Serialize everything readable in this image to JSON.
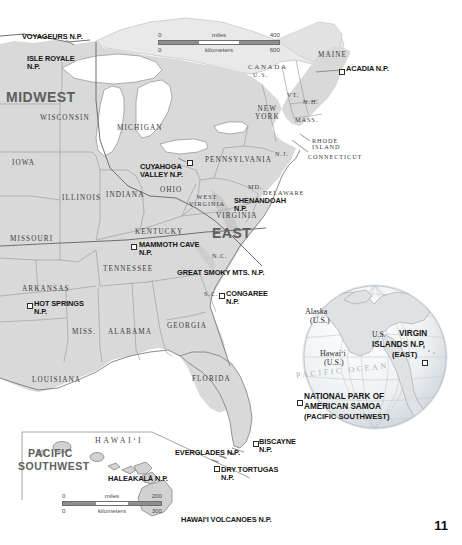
{
  "page": {
    "number": "11"
  },
  "main_map": {
    "regions": [
      {
        "name": "MIDWEST",
        "x": 6,
        "y": 92,
        "size": "big"
      },
      {
        "name": "EAST",
        "x": 212,
        "y": 228,
        "size": "big"
      }
    ],
    "country_labels": [
      {
        "name": "CANADA",
        "x": 248,
        "y": 66
      },
      {
        "name": "U.S.",
        "x": 252,
        "y": 74
      }
    ],
    "states": [
      {
        "name": "WISCONSIN",
        "x": 40,
        "y": 116
      },
      {
        "name": "MICHIGAN",
        "x": 117,
        "y": 126
      },
      {
        "name": "IOWA",
        "x": 12,
        "y": 161
      },
      {
        "name": "ILLINOIS",
        "x": 62,
        "y": 196
      },
      {
        "name": "INDIANA",
        "x": 106,
        "y": 193
      },
      {
        "name": "OHIO",
        "x": 160,
        "y": 188
      },
      {
        "name": "MISSOURI",
        "x": 10,
        "y": 237
      },
      {
        "name": "KENTUCKY",
        "x": 135,
        "y": 230
      },
      {
        "name": "TENNESSEE",
        "x": 103,
        "y": 267
      },
      {
        "name": "ARKANSAS",
        "x": 22,
        "y": 287
      },
      {
        "name": "MISS.",
        "x": 72,
        "y": 330
      },
      {
        "name": "ALABAMA",
        "x": 108,
        "y": 330
      },
      {
        "name": "GEORGIA",
        "x": 167,
        "y": 324
      },
      {
        "name": "LOUISIANA",
        "x": 32,
        "y": 378
      },
      {
        "name": "FLORIDA",
        "x": 192,
        "y": 377
      },
      {
        "name": "S.C.",
        "x": 204,
        "y": 292
      },
      {
        "name": "N.C.",
        "x": 212,
        "y": 254
      },
      {
        "name": "VIRGINIA",
        "x": 216,
        "y": 214
      },
      {
        "name": "WEST\nVIRGINIA",
        "x": 189,
        "y": 195
      },
      {
        "name": "PENNSYLVANIA",
        "x": 208,
        "y": 158
      },
      {
        "name": "MD.",
        "x": 248,
        "y": 185
      },
      {
        "name": "DELAWARE",
        "x": 263,
        "y": 191
      },
      {
        "name": "N.J.",
        "x": 275,
        "y": 152
      },
      {
        "name": "NEW\nYORK",
        "x": 257,
        "y": 110
      },
      {
        "name": "VT.",
        "x": 288,
        "y": 93
      },
      {
        "name": "N.H.",
        "x": 304,
        "y": 100
      },
      {
        "name": "MASS.",
        "x": 296,
        "y": 118
      },
      {
        "name": "MAINE",
        "x": 318,
        "y": 53
      }
    ],
    "callout_states": [
      {
        "name": "RHODE\nISLAND",
        "x": 315,
        "y": 142
      },
      {
        "name": "CONNECTICUT",
        "x": 310,
        "y": 156
      }
    ],
    "parks": [
      {
        "name": "VOYAGEURS N.P.",
        "label_x": 22,
        "label_y": 35,
        "pin_x": 74,
        "pin_y": 45
      },
      {
        "name": "ISLE ROYALE\nN.P.",
        "label_x": 27,
        "label_y": 57,
        "pin_x": 79,
        "pin_y": 72
      },
      {
        "name": "CUYAHOGA\nVALLEY N.P.",
        "label_x": 143,
        "label_y": 164,
        "pin_x": 188,
        "pin_y": 161
      },
      {
        "name": "ACADIA N.P.",
        "label_x": 345,
        "label_y": 68,
        "pin_x": 340,
        "pin_y": 70
      },
      {
        "name": "SHENANDOAH\nN.P.",
        "label_x": 238,
        "label_y": 199,
        "pin_x": 233,
        "pin_y": 203
      },
      {
        "name": "MAMMOTH CAVE\nN.P.",
        "label_x": 141,
        "label_y": 243,
        "pin_x": 133,
        "pin_y": 245
      },
      {
        "name": "GREAT SMOKY MTS. N.P.",
        "label_x": 180,
        "label_y": 271,
        "pin_x": 176,
        "pin_y": 273
      },
      {
        "name": "CONGAREE\nN.P.",
        "label_x": 225,
        "label_y": 292,
        "pin_x": 220,
        "pin_y": 295
      },
      {
        "name": "HOT SPRINGS\nN.P.",
        "label_x": 33,
        "label_y": 302,
        "pin_x": 28,
        "pin_y": 304
      },
      {
        "name": "EVERGLADES N.P.",
        "label_x": 175,
        "label_y": 451,
        "pin_x": 245,
        "pin_y": 450
      },
      {
        "name": "BISCAYNE\nN.P.",
        "label_x": 258,
        "label_y": 441,
        "pin_x": 254,
        "pin_y": 443
      },
      {
        "name": "DRY TORTUGAS\nN.P.",
        "label_x": 220,
        "label_y": 469,
        "pin_x": 215,
        "pin_y": 468
      },
      {
        "name": "HAWAIʻI VOLCANOES N.P.",
        "label_x": 181,
        "label_y": 518,
        "pin_x": 176,
        "pin_y": 516
      },
      {
        "name": "HALEAKALĀ N.P.",
        "label_x": 110,
        "label_y": 478,
        "pin_x": 106,
        "pin_y": 476
      }
    ],
    "scale": {
      "miles_label": "miles",
      "kilometers_label": "kilometers",
      "miles_min": "0",
      "miles_max": "400",
      "km_min": "0",
      "km_max": "600"
    }
  },
  "hawaii_inset": {
    "region": "PACIFIC\nSOUTHWEST",
    "region_line1": "PACIFIC",
    "region_line2": "SOUTHWEST",
    "archipelago_label": "HAWAIʻI",
    "scale": {
      "miles_label": "miles",
      "kilometers_label": "kilometers",
      "miles_min": "0",
      "miles_max": "200",
      "km_min": "0",
      "km_max": "300"
    }
  },
  "globe_inset": {
    "labels": [
      {
        "name": "Alaska\n(U.S.)",
        "line1": "Alaska",
        "line2": "(U.S.)",
        "x": 322,
        "y": 312
      },
      {
        "name": "Hawaiʻi\n(U.S.)",
        "line1": "Hawaiʻi",
        "line2": "(U.S.)",
        "x": 318,
        "y": 355
      }
    ],
    "ocean": "PACIFIC OCEAN",
    "virgin_islands": {
      "line1": "U.S.",
      "line2": "VIRGIN",
      "line3": "ISLANDS N.P.",
      "line4": "(EAST)"
    },
    "american_samoa": {
      "line1": "NATIONAL PARK OF",
      "line2": "AMERICAN SAMOA",
      "line3": "(PACIFIC SOUTHWEST)"
    }
  },
  "colors": {
    "land": "#d9d9d9",
    "land_light": "#e4e4e4",
    "water": "#ffffff",
    "border": "#8a8a8a",
    "coast": "#6e6e6e",
    "region_text": "#5e5e5e",
    "globe_fill": "#eceff1",
    "globe_grid": "#c2cbd2"
  }
}
